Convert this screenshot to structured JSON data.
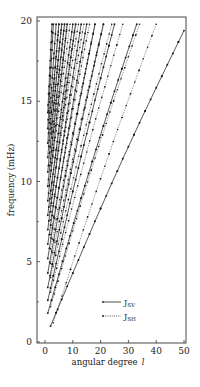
{
  "chart_data": {
    "type": "scatter",
    "title": "",
    "xlabel": "angular degree",
    "xlabel_symbol": "l",
    "ylabel": "frequency (mHz)",
    "xlim": [
      -3,
      51
    ],
    "ylim": [
      0,
      20
    ],
    "xticks": [
      0,
      10,
      20,
      30,
      40,
      50
    ],
    "yticks": [
      0,
      5,
      10,
      15,
      20
    ],
    "ytick_labels": [
      "0",
      "5",
      "10",
      "15",
      "20"
    ],
    "xtick_labels": [
      "0",
      "10",
      "20",
      "30",
      "40",
      "50"
    ],
    "grid": false,
    "legend": {
      "position": "lower right",
      "entries": [
        {
          "label": "J",
          "subscript": "SV",
          "style": "solid"
        },
        {
          "label": "J",
          "subscript": "SH",
          "style": "dotted"
        }
      ]
    },
    "series": [
      {
        "name": "J_SV",
        "style": "solid",
        "branches": [
          {
            "l0": 2,
            "f0": 1.0,
            "l1": 50,
            "f1": 19.4
          },
          {
            "l0": 1,
            "f0": 1.8,
            "l1": 33,
            "f1": 19.8
          },
          {
            "l0": 1,
            "f0": 2.6,
            "l1": 25,
            "f1": 19.8
          },
          {
            "l0": 1,
            "f0": 3.4,
            "l1": 21,
            "f1": 19.8
          },
          {
            "l0": 1,
            "f0": 4.3,
            "l1": 18,
            "f1": 19.8
          },
          {
            "l0": 1,
            "f0": 5.2,
            "l1": 15,
            "f1": 19.8
          },
          {
            "l0": 1,
            "f0": 6.1,
            "l1": 13,
            "f1": 19.8
          },
          {
            "l0": 1,
            "f0": 7.0,
            "l1": 11,
            "f1": 19.8
          },
          {
            "l0": 1,
            "f0": 7.9,
            "l1": 10,
            "f1": 19.8
          },
          {
            "l0": 1,
            "f0": 8.8,
            "l1": 8,
            "f1": 19.8
          },
          {
            "l0": 1,
            "f0": 9.7,
            "l1": 7,
            "f1": 19.8
          },
          {
            "l0": 1,
            "f0": 10.6,
            "l1": 6,
            "f1": 19.8
          },
          {
            "l0": 1,
            "f0": 11.5,
            "l1": 5,
            "f1": 19.8
          },
          {
            "l0": 1,
            "f0": 12.4,
            "l1": 4,
            "f1": 19.8
          },
          {
            "l0": 1,
            "f0": 13.3,
            "l1": 3,
            "f1": 19.8
          },
          {
            "l0": 1,
            "f0": 14.3,
            "l1": 2.5,
            "f1": 19.8
          }
        ]
      },
      {
        "name": "J_SH",
        "style": "dotted",
        "branches": [
          {
            "l0": 3,
            "f0": 1.2,
            "l1": 40,
            "f1": 19.8
          },
          {
            "l0": 2,
            "f0": 2.2,
            "l1": 34,
            "f1": 19.8
          },
          {
            "l0": 2,
            "f0": 3.1,
            "l1": 28,
            "f1": 19.8
          },
          {
            "l0": 2,
            "f0": 4.0,
            "l1": 24,
            "f1": 19.8
          },
          {
            "l0": 2,
            "f0": 4.9,
            "l1": 21,
            "f1": 19.8
          },
          {
            "l0": 2,
            "f0": 5.8,
            "l1": 18,
            "f1": 19.8
          },
          {
            "l0": 2,
            "f0": 6.7,
            "l1": 16,
            "f1": 19.8
          },
          {
            "l0": 2,
            "f0": 7.6,
            "l1": 14,
            "f1": 19.8
          },
          {
            "l0": 2,
            "f0": 8.5,
            "l1": 12,
            "f1": 19.8
          },
          {
            "l0": 2,
            "f0": 9.4,
            "l1": 11,
            "f1": 19.8
          },
          {
            "l0": 2,
            "f0": 10.3,
            "l1": 9,
            "f1": 19.8
          },
          {
            "l0": 2,
            "f0": 11.2,
            "l1": 8,
            "f1": 19.8
          },
          {
            "l0": 2,
            "f0": 12.1,
            "l1": 7,
            "f1": 19.8
          },
          {
            "l0": 2,
            "f0": 13.0,
            "l1": 6,
            "f1": 19.8
          },
          {
            "l0": 2,
            "f0": 13.9,
            "l1": 5,
            "f1": 19.8
          }
        ]
      }
    ]
  }
}
